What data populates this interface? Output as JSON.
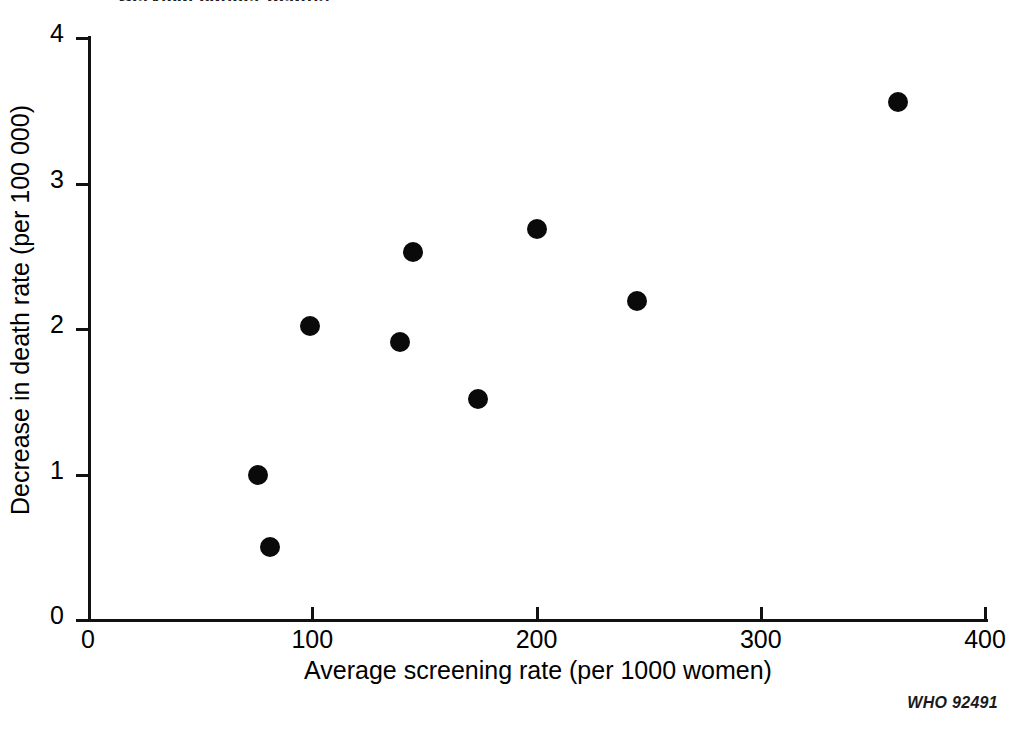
{
  "figure": {
    "title_partial": "Cervical cancer deaths",
    "credit": "WHO 92491",
    "background": "#ffffff",
    "ink_color": "#0a0a0a"
  },
  "chart_data": {
    "type": "scatter",
    "title": "",
    "xlabel": "Average screening rate (per 1000 women)",
    "ylabel": "Decrease in death rate (per 100 000)",
    "xlim": [
      0,
      400
    ],
    "ylim": [
      0,
      4
    ],
    "xticks": [
      0,
      100,
      200,
      300,
      400
    ],
    "yticks": [
      0,
      1,
      2,
      3,
      4
    ],
    "xticklabels": [
      "0",
      "100",
      "200",
      "300",
      "400"
    ],
    "yticklabels": [
      "0",
      "1",
      "2",
      "3",
      "4"
    ],
    "grid": false,
    "legend": null,
    "marker": {
      "shape": "circle",
      "filled": true,
      "color": "#0a0a0a",
      "size_px": 20
    },
    "points": [
      {
        "x": 76,
        "y": 1.0
      },
      {
        "x": 81,
        "y": 0.5
      },
      {
        "x": 99,
        "y": 2.02
      },
      {
        "x": 139,
        "y": 1.91
      },
      {
        "x": 145,
        "y": 2.53
      },
      {
        "x": 174,
        "y": 1.52
      },
      {
        "x": 200,
        "y": 2.69
      },
      {
        "x": 245,
        "y": 2.19
      },
      {
        "x": 361,
        "y": 3.56
      }
    ]
  }
}
